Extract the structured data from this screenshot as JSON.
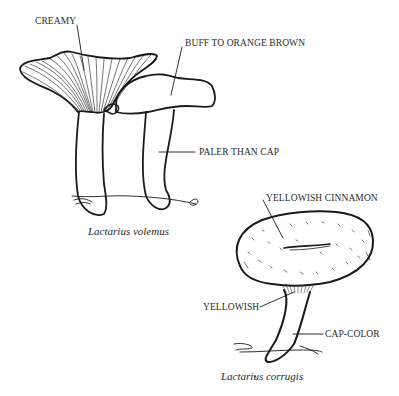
{
  "figures": [
    {
      "species": "Lactarius volemus",
      "labels": {
        "gills": "CREAMY",
        "cap": "BUFF TO ORANGE BROWN",
        "stem": "PALER THAN CAP"
      }
    },
    {
      "species": "Lactarius corrugis",
      "labels": {
        "cap": "YELLOWISH CINNAMON",
        "gills": "YELLOWISH",
        "stem": "CAP-COLOR"
      }
    }
  ],
  "colors": {
    "ink": "#1a1a1a",
    "background": "#ffffff"
  }
}
